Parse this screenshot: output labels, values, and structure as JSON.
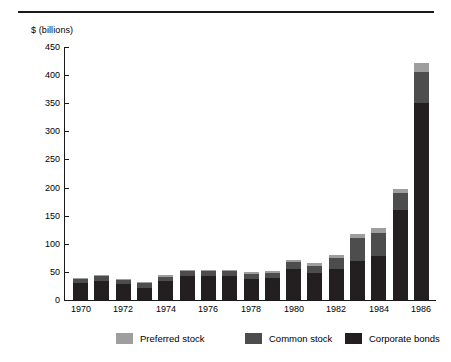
{
  "chart_data": {
    "type": "bar",
    "subtype": "stacked",
    "title": "",
    "xlabel": "",
    "ylabel": "$ (billions)",
    "ylim": [
      0,
      450
    ],
    "ytick_values": [
      0,
      50,
      100,
      150,
      200,
      250,
      300,
      350,
      400,
      450
    ],
    "ytick_labels": [
      "0",
      "50",
      "100",
      "150",
      "200",
      "250",
      "300",
      "350",
      "400",
      "450"
    ],
    "grid": false,
    "legend_position": "bottom",
    "categories": [
      "1970",
      "1971",
      "1972",
      "1973",
      "1974",
      "1975",
      "1976",
      "1977",
      "1978",
      "1979",
      "1980",
      "1981",
      "1982",
      "1983",
      "1984",
      "1985",
      "1986"
    ],
    "xtick_labels": [
      "1970",
      "1972",
      "1974",
      "1976",
      "1978",
      "1980",
      "1982",
      "1984",
      "1986"
    ],
    "series": [
      {
        "name": "Corporate bonds",
        "color": "#231f20",
        "values": [
          31,
          33,
          28,
          22,
          33,
          43,
          43,
          43,
          38,
          40,
          55,
          48,
          55,
          70,
          78,
          160,
          350
        ]
      },
      {
        "name": "Common stock",
        "color": "#4d4d4d",
        "values": [
          7,
          9,
          8,
          8,
          8,
          8,
          8,
          8,
          8,
          8,
          12,
          13,
          20,
          40,
          42,
          30,
          55
        ]
      },
      {
        "name": "Preferred stock",
        "color": "#9e9e9e",
        "values": [
          2,
          2,
          2,
          2,
          3,
          3,
          3,
          3,
          3,
          3,
          4,
          4,
          5,
          8,
          9,
          8,
          17
        ]
      }
    ],
    "totals": [
      40,
      44,
      38,
      32,
      44,
      54,
      54,
      54,
      49,
      51,
      71,
      65,
      80,
      118,
      129,
      198,
      422
    ]
  },
  "legend": {
    "items": [
      {
        "label": "Preferred stock",
        "color": "#9e9e9e"
      },
      {
        "label": "Common stock",
        "color": "#4d4d4d"
      },
      {
        "label": "Corporate bonds",
        "color": "#231f20"
      }
    ]
  }
}
